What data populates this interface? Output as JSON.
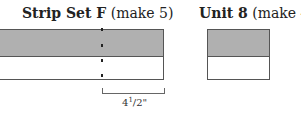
{
  "strip_set": {
    "title_bold": "Strip Set F",
    "title_rest": " (make 5)",
    "top_color": "#b0b0b0",
    "bottom_color": "#ffffff"
  },
  "unit": {
    "title_bold": "Unit 8",
    "title_rest": " (make 40)"
  },
  "measurement": {
    "whole": "4",
    "numerator": "1",
    "slash": "/",
    "denominator": "2",
    "unit": "\""
  }
}
